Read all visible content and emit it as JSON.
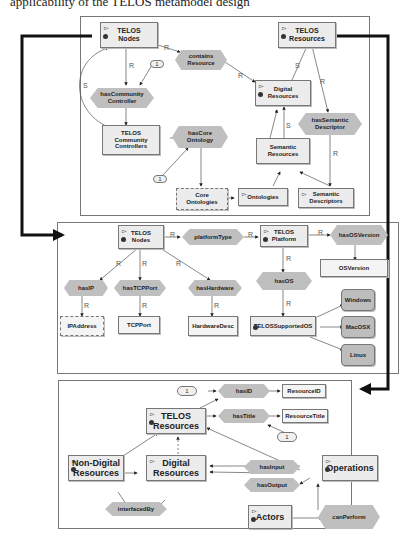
{
  "top_text": "applicability of the TELOS metamodel design",
  "panels": {
    "top": {
      "nodes": {
        "telos_nodes": "TELOS\nNodes",
        "telos_resources": "TELOS\nResources",
        "contains_resource": "contains\nResource",
        "has_community_controller": "hasCommunity\nController",
        "digital_resources": "Digital\nResources",
        "has_semantic_descriptor": "hasSemantic\nDescriptor",
        "telos_community_controllers": "TELOS\nCommunity\nControllers",
        "has_core_ontology": "hasCore\nOntology",
        "semantic_resources": "Semantic\nResources",
        "core_ontologies": "Core\nOntologies",
        "ontologies": "Ontologies",
        "semantic_descriptors": "Semantic\nDescriptors"
      },
      "cardinality": [
        "1",
        "1"
      ],
      "edge_labels": {
        "R": "R",
        "S": "S"
      }
    },
    "middle": {
      "nodes": {
        "telos_nodes": "TELOS\nNodes",
        "platform_type": "platformType",
        "telos_platform": "TELOS\nPlatform",
        "has_os_version": "hasOSVersion",
        "os_version": "OSVersion",
        "has_ip": "hasIP",
        "has_tcp_port": "hasTCPPort",
        "has_hardware": "hasHardware",
        "has_os": "hasOS",
        "ip_address": "IPAddress",
        "tcp_port": "TCPPort",
        "hardware_desc": "HardwareDesc",
        "telos_supported_os": "TELOSSupportedOS",
        "windows": "Windows",
        "macosx": "MacOSX",
        "linux": "Linux"
      },
      "edge_labels": {
        "R": "R",
        "I": "I"
      }
    },
    "bottom": {
      "nodes": {
        "has_id": "hasID",
        "resource_id": "ResourceID",
        "telos_resources": "TELOS\nResources",
        "has_title": "hasTitle",
        "resource_title": "ResourceTitle",
        "non_digital_resources": "Non-Digital\nResources",
        "digital_resources": "Digital\nResources",
        "has_input": "hasInput",
        "has_output": "hasOutput",
        "operations": "Operations",
        "interfaced_by": "interfacedBy",
        "actors": "Actors",
        "can_perform": "canPerform"
      },
      "cardinality": [
        "1",
        "1"
      ],
      "edge_labels": {
        "R": "R",
        "S": "S"
      }
    }
  },
  "colors": {
    "node_fill": "#ececec",
    "hex_fill": "#bfbfbf",
    "dark_node_fill": "#bdbdbd",
    "border": "#777777",
    "connector": "#111111"
  }
}
